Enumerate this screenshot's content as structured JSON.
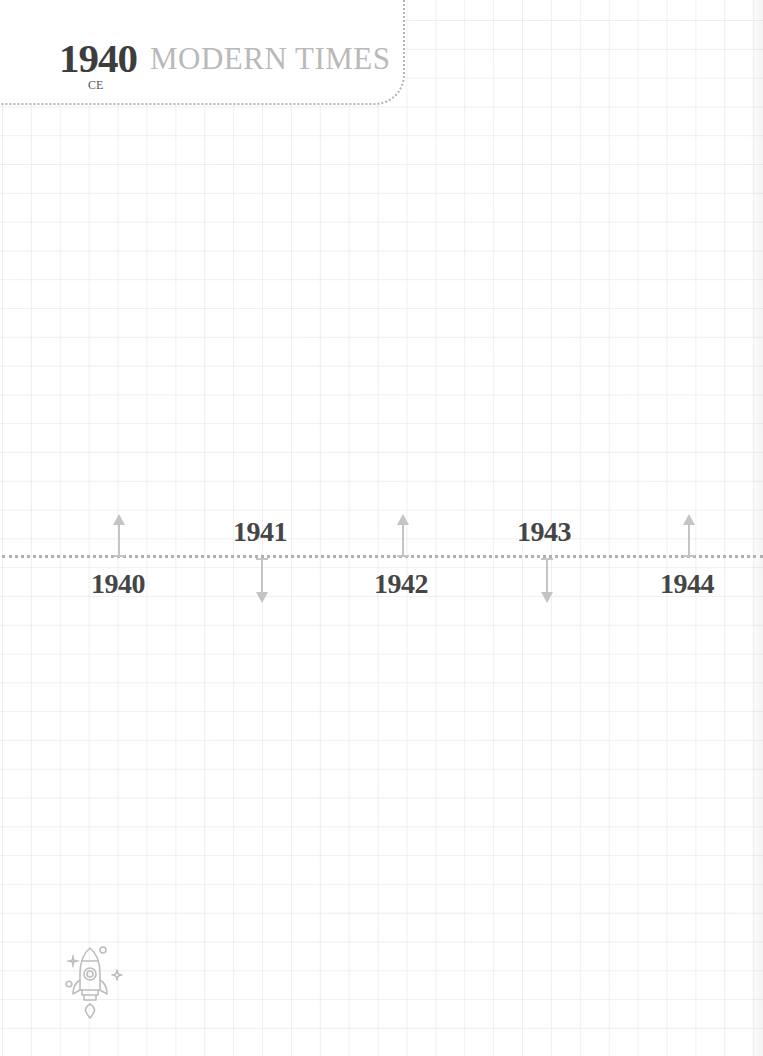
{
  "header": {
    "year": "1940",
    "era_suffix": "CE",
    "title": "MODERN TIMES"
  },
  "timeline": {
    "events": [
      {
        "year": "1940",
        "arrow": "up",
        "label_position": "below",
        "x": 119
      },
      {
        "year": "1941",
        "arrow": "down",
        "label_position": "above",
        "x": 262
      },
      {
        "year": "1942",
        "arrow": "up",
        "label_position": "below",
        "x": 403
      },
      {
        "year": "1943",
        "arrow": "down",
        "label_position": "above",
        "x": 547
      },
      {
        "year": "1944",
        "arrow": "up",
        "label_position": "below",
        "x": 688
      }
    ]
  },
  "decorations": {
    "footer_icon": "rocket-icon"
  },
  "colors": {
    "year_text": "#3d3d3d",
    "title_text": "#b9b9b9",
    "arrow": "#c4c4c4",
    "dotted_line": "#b0b0b0",
    "grid": "#e6e6e6"
  }
}
